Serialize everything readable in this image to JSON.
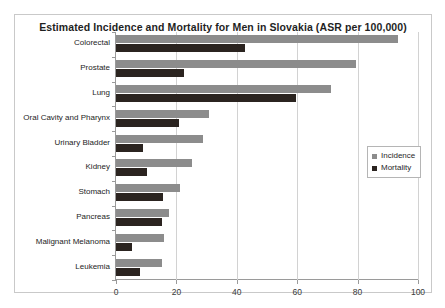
{
  "chart_data": {
    "type": "bar",
    "orientation": "horizontal",
    "title": "Estimated Incidence and Mortality for Men in Slovakia (ASR per 100,000)",
    "xlabel": "",
    "ylabel": "",
    "xlim": [
      0,
      100
    ],
    "xticks": [
      0,
      20,
      40,
      60,
      80,
      100
    ],
    "grid": true,
    "legend_position": "right",
    "categories": [
      "Colorectal",
      "Prostate",
      "Lung",
      "Oral Cavity and Pharynx",
      "Urinary Bladder",
      "Kidney",
      "Stomach",
      "Pancreas",
      "Malignant Melanoma",
      "Leukemia"
    ],
    "series": [
      {
        "name": "Incidence",
        "color": "#8c8c8c",
        "values": [
          93.4,
          79.5,
          71.2,
          30.8,
          28.8,
          25.2,
          21.2,
          17.7,
          15.9,
          15.2
        ]
      },
      {
        "name": "Mortality",
        "color": "#2b2420",
        "values": [
          42.7,
          22.5,
          59.6,
          20.9,
          8.9,
          10.2,
          15.5,
          15.2,
          5.3,
          8.0
        ]
      }
    ]
  },
  "legend": {
    "items": [
      {
        "label": "Incidence"
      },
      {
        "label": "Mortality"
      }
    ]
  }
}
